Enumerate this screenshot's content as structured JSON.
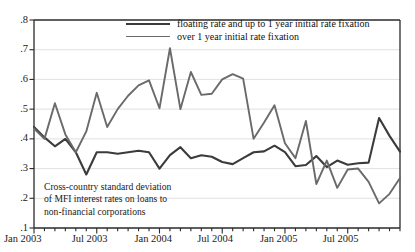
{
  "chart_data": {
    "type": "line",
    "title": "",
    "xlabel": "",
    "ylabel": "",
    "grid": true,
    "legend_position": "top-center",
    "ylim": [
      0.1,
      0.8
    ],
    "ytick_labels": [
      ".8",
      ".7",
      ".6",
      ".5",
      ".4",
      ".3",
      ".2",
      ".1"
    ],
    "ytick_values": [
      0.8,
      0.7,
      0.6,
      0.5,
      0.4,
      0.3,
      0.2,
      0.1
    ],
    "xtick_labels": [
      "Jan 2003",
      "Jul 2003",
      "Jan 2004",
      "Jul 2004",
      "Jan 2005",
      "Jul 2005"
    ],
    "xtick_indices": [
      0,
      6,
      12,
      18,
      24,
      30
    ],
    "x": [
      "Jan 2003",
      "Feb 2003",
      "Mar 2003",
      "Apr 2003",
      "May 2003",
      "Jun 2003",
      "Jul 2003",
      "Aug 2003",
      "Sep 2003",
      "Oct 2003",
      "Nov 2003",
      "Dec 2003",
      "Jan 2004",
      "Feb 2004",
      "Mar 2004",
      "Apr 2004",
      "May 2004",
      "Jun 2004",
      "Jul 2004",
      "Aug 2004",
      "Sep 2004",
      "Oct 2004",
      "Nov 2004",
      "Dec 2004",
      "Jan 2005",
      "Feb 2005",
      "Mar 2005",
      "Apr 2005",
      "May 2005",
      "Jun 2005",
      "Jul 2005",
      "Aug 2005",
      "Sep 2005",
      "Oct 2005",
      "Nov 2005",
      "Dec 2005"
    ],
    "series": [
      {
        "name": "floating rate and up to 1 year initial rate fixation",
        "color": "#3b3b3b",
        "width": 2.1,
        "values": [
          0.44,
          0.405,
          0.375,
          0.4,
          0.355,
          0.28,
          0.355,
          0.355,
          0.35,
          0.355,
          0.36,
          0.355,
          0.3,
          0.345,
          0.372,
          0.335,
          0.345,
          0.34,
          0.322,
          0.315,
          0.335,
          0.355,
          0.358,
          0.377,
          0.355,
          0.308,
          0.312,
          0.342,
          0.305,
          0.327,
          0.313,
          0.318,
          0.32,
          0.47,
          0.41,
          0.357
        ]
      },
      {
        "name": "over 1 year initial rate fixation",
        "color": "#6a6a6a",
        "width": 1.9,
        "values": [
          0.435,
          0.4,
          0.52,
          0.415,
          0.355,
          0.425,
          0.555,
          0.44,
          0.5,
          0.545,
          0.58,
          0.597,
          0.503,
          0.705,
          0.5,
          0.625,
          0.548,
          0.552,
          0.6,
          0.618,
          0.603,
          0.4,
          0.455,
          0.513,
          0.385,
          0.335,
          0.46,
          0.248,
          0.327,
          0.235,
          0.297,
          0.3,
          0.255,
          0.183,
          0.215,
          0.268
        ]
      }
    ],
    "annotation": {
      "line1": "Cross-country standard deviation",
      "line2": "of MFI interest rates on loans to",
      "line3": "non-financial corporations"
    }
  }
}
